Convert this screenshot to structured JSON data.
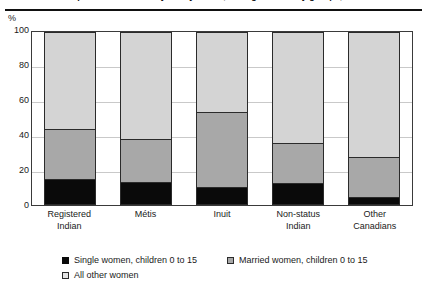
{
  "title": "Proportion of women by family status, Aboriginal identity groups, 2001",
  "axis": {
    "y_unit": "%",
    "y_ticks": [
      "100",
      "80",
      "60",
      "40",
      "20",
      "0"
    ]
  },
  "legend": {
    "items": [
      {
        "label": "Single women, children 0 to 15",
        "swatch": "black-square-icon",
        "color": "#0a0a0a"
      },
      {
        "label": "Married women, children 0 to 15",
        "swatch": "gray-square-icon",
        "color": "#a8a8a8"
      },
      {
        "label": "All other women",
        "swatch": "light-gray-square-icon",
        "color": "#e4e4e4"
      }
    ]
  },
  "chart_data": {
    "type": "bar",
    "stacked": true,
    "title": "Proportion of women by family status, Aboriginal identity groups, 2001",
    "xlabel": "",
    "ylabel": "%",
    "ylim": [
      0,
      100
    ],
    "yticks": [
      0,
      20,
      40,
      60,
      80,
      100
    ],
    "grid": true,
    "legend_position": "bottom-left",
    "categories": [
      "Registered Indian",
      "Métis",
      "Inuit",
      "Non-status Indian",
      "Other Canadians"
    ],
    "category_lines": [
      [
        "Registered",
        "Indian"
      ],
      [
        "Métis"
      ],
      [
        "Inuit"
      ],
      [
        "Non-status",
        "Indian"
      ],
      [
        "Other",
        "Canadians"
      ]
    ],
    "series": [
      {
        "name": "Single women, children 0 to 15",
        "color": "#0a0a0a",
        "values": [
          15,
          13.5,
          10.5,
          12.5,
          4.5
        ]
      },
      {
        "name": "Married women, children 0 to 15",
        "color": "#a8a8a8",
        "values": [
          29,
          24.5,
          43.5,
          23.5,
          23.5
        ]
      },
      {
        "name": "All other women",
        "color": "#d4d4d4",
        "values": [
          56,
          62,
          46,
          64,
          72
        ]
      }
    ],
    "cumulative_tops": [
      [
        15,
        44,
        100
      ],
      [
        13.5,
        38,
        100
      ],
      [
        10.5,
        54,
        100
      ],
      [
        12.5,
        36,
        100
      ],
      [
        4.5,
        28,
        100
      ]
    ]
  }
}
